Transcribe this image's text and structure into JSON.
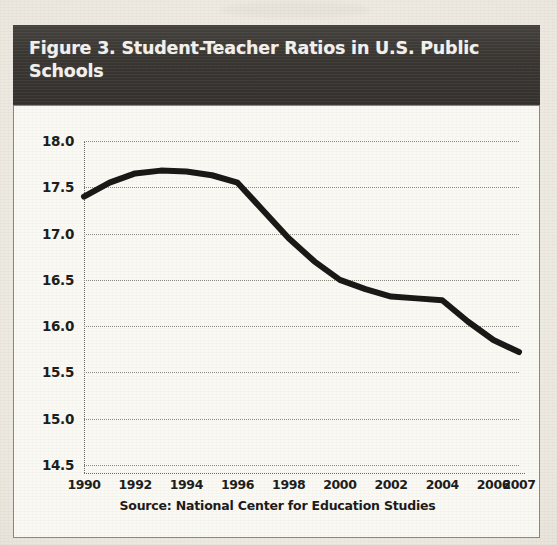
{
  "figure": {
    "title": "Figure 3. Student-Teacher Ratios in U.S. Public Schools",
    "source_note": "Source: National Center for Education Studies"
  },
  "colors": {
    "banner_background": "#3a3733",
    "banner_text": "#f4f2ee",
    "page_background": "#ece8df",
    "plot_background": "#fbf9f3",
    "line": "#1a1917",
    "gridline": "#8e8a82",
    "axis_text": "#201e1c"
  },
  "chart_data": {
    "type": "line",
    "title": "Figure 3. Student-Teacher Ratios in U.S. Public Schools",
    "subtitle": "",
    "xlabel": "",
    "ylabel": "",
    "x": [
      1990,
      1991,
      1992,
      1993,
      1994,
      1995,
      1996,
      1997,
      1998,
      1999,
      2000,
      2001,
      2002,
      2003,
      2004,
      2005,
      2006,
      2007
    ],
    "series": [
      {
        "name": "Student-Teacher Ratio",
        "values": [
          17.4,
          17.55,
          17.65,
          17.68,
          17.67,
          17.63,
          17.55,
          17.25,
          16.95,
          16.7,
          16.5,
          16.4,
          16.32,
          16.3,
          16.28,
          16.05,
          15.85,
          15.72
        ]
      }
    ],
    "xlim": [
      1990,
      2007
    ],
    "ylim": [
      14.5,
      18.0
    ],
    "xticks": [
      1990,
      1992,
      1994,
      1996,
      1998,
      2000,
      2002,
      2004,
      2006,
      2007
    ],
    "xtick_labels": [
      "1990",
      "1992",
      "1994",
      "1996",
      "1998",
      "2000",
      "2002",
      "2004",
      "2006",
      "2007"
    ],
    "yticks": [
      14.5,
      15.0,
      15.5,
      16.0,
      16.5,
      17.0,
      17.5,
      18.0
    ],
    "ytick_labels": [
      "14.5",
      "15.0",
      "15.5",
      "16.0",
      "16.5",
      "17.0",
      "17.5",
      "18.0"
    ],
    "grid": true,
    "grid_style": "dotted-horizontal",
    "legend": false,
    "legend_position": "none",
    "markers": false,
    "line_width_px": 6,
    "annotations": []
  }
}
